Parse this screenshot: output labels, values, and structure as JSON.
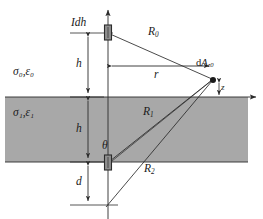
{
  "figure": {
    "type": "physics-geometry-diagram",
    "colors": {
      "slab_fill": "#a8a8a8",
      "stroke": "#2b2b2b",
      "background": "#ffffff",
      "marker_fill": "#8f8f8f"
    },
    "labels": {
      "source_element": "Idh",
      "medium_upper": "σ₀,ε₀",
      "medium_lower": "σ₁,ε₁",
      "height_upper": "h",
      "height_lower": "h",
      "depth": "d",
      "radial": "r",
      "vertical_offset": "z",
      "ray_direct": "R",
      "ray_direct_sub": "0",
      "ray_one": "R",
      "ray_one_sub": "1",
      "ray_two": "R",
      "ray_two_sub": "2",
      "angle": "θ",
      "field_point": "dA",
      "field_point_sub": "z0"
    },
    "geometry": {
      "slab_top_y": 97,
      "slab_bottom_y": 162,
      "slab_left_x": 5,
      "slab_right_x": 248,
      "axis_x": 108,
      "source_y": 33,
      "image_y": 162,
      "field_point_x": 213,
      "field_point_y": 80,
      "bottom_vertex_y": 207
    }
  }
}
